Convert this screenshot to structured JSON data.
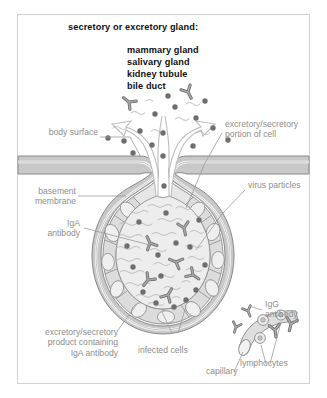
{
  "figure": {
    "title": "secretory or excretory gland:",
    "examples": [
      "mammary gland",
      "salivary gland",
      "kidney tubule",
      "bile duct"
    ],
    "examples_text": "mammary gland\nsalivary gland\nkidney tubule\nbile duct"
  },
  "labels": {
    "body_surface": "body surface",
    "basement_membrane": "basement\nmembrane",
    "iga_antibody": "IgA\nantibody",
    "excretory_product": "excretory/secretory\nproduct containing\nIgA antibody",
    "infected_cells": "infected cells",
    "capillary": "capillary",
    "lymphocytes": "lymphocytes",
    "igg_antibody": "IgG\nantibody",
    "virus_particles": "virus particles",
    "excretory_portion": "excretory/secretory\nportion of cell"
  },
  "colors": {
    "title_text": "#111111",
    "label_text": "#8e8e8e",
    "frame_border": "#d2d2d2",
    "leader_line": "#9a9a9a",
    "outline": "#8a8a8a",
    "membrane_fill": "#c8c8c8",
    "cell_fill": "#dcdcdc",
    "cell_fill_light": "#e6e6e6",
    "lumen_fill": "#ededed",
    "nucleus_fill": "#efefef",
    "virus_dot": "#6e6e6e",
    "antibody_fill": "#9e9e9e",
    "antibody_stroke": "#6f6f6f",
    "secretion_outline": "#bdbdbd",
    "capillary_fill": "#dedede",
    "background": "#ffffff"
  },
  "structures": {
    "duct_opening": "duct-opening",
    "acinus": "gland-acinus",
    "lumen": "acinar-lumen",
    "epithelial_cells": "epithelial-cell-ring",
    "capillary_vessel": "capillary-vessel"
  }
}
